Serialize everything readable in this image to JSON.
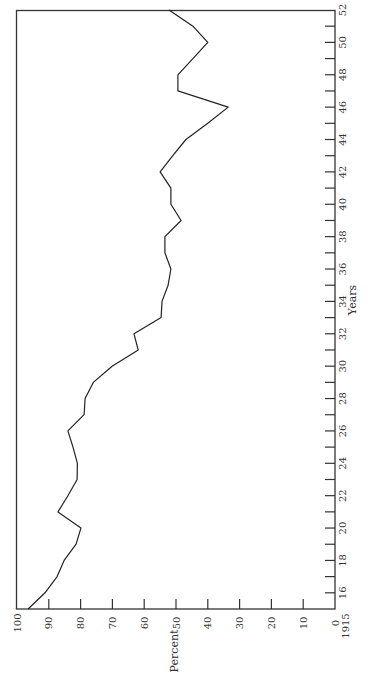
{
  "chart_data": {
    "type": "line",
    "orientation": "rotated-90",
    "title": "",
    "xlabel": "Years",
    "ylabel": "Percent",
    "x_tick_labels": [
      "1915",
      "16",
      "18",
      "20",
      "22",
      "24",
      "26",
      "28",
      "30",
      "32",
      "34",
      "36",
      "38",
      "40",
      "42",
      "44",
      "46",
      "48",
      "50",
      "52"
    ],
    "y_tick_labels": [
      "100",
      "90",
      "80",
      "70",
      "60",
      "50",
      "40",
      "30",
      "20",
      "10",
      "0"
    ],
    "xlim": [
      1915,
      1952
    ],
    "ylim": [
      0,
      100
    ],
    "grid": false,
    "legend": null,
    "series": [
      {
        "name": "Percent",
        "x": [
          1915,
          1916,
          1917,
          1918,
          1919,
          1920,
          1921,
          1922,
          1923,
          1924,
          1925,
          1926,
          1927,
          1928,
          1929,
          1930,
          1931,
          1932,
          1933,
          1934,
          1935,
          1936,
          1937,
          1938,
          1939,
          1940,
          1941,
          1942,
          1943,
          1944,
          1945,
          1946,
          1947,
          1948,
          1949,
          1950,
          1951,
          1952
        ],
        "values": [
          96.5,
          91.2,
          87.4,
          85.2,
          81.4,
          79.9,
          87.1,
          84.0,
          81.1,
          81.0,
          82.4,
          84.0,
          78.9,
          78.6,
          76.0,
          70.1,
          61.9,
          63.2,
          54.7,
          54.4,
          52.5,
          51.6,
          53.5,
          53.5,
          48.4,
          51.6,
          51.6,
          55.0,
          51.0,
          46.9,
          40.0,
          33.6,
          49.4,
          49.4,
          44.7,
          40.0,
          44.7,
          52.2
        ]
      }
    ]
  },
  "labels": {
    "years": "Years",
    "percent": "Percent"
  },
  "style": {
    "line_color": "#222222",
    "frame_color": "#333333",
    "text_color": "#333333"
  }
}
